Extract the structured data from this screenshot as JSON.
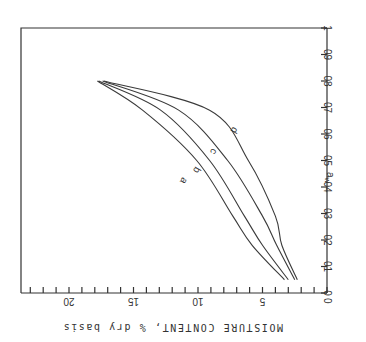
{
  "chart_data": {
    "type": "line",
    "orientation_note": "figure rendered rotated 90 degrees clockwise",
    "xlabel": "a_w",
    "ylabel": "MOISTURE CONTENT, % dry basis",
    "xlim": [
      0,
      1
    ],
    "ylim": [
      0,
      24
    ],
    "x_ticks": [
      "0",
      "0.1",
      "0.2",
      "0.3",
      "0.4",
      "0.5",
      "0.6",
      "0.7",
      "0.8",
      "0.9",
      "1"
    ],
    "x_tick_values": [
      0,
      0.1,
      0.2,
      0.3,
      0.4,
      0.5,
      0.6,
      0.7,
      0.8,
      0.9,
      1.0
    ],
    "y_ticks": [
      "0",
      "5",
      "10",
      "15",
      "20"
    ],
    "y_tick_values": [
      0,
      5,
      10,
      15,
      20
    ],
    "y_minor_step": 1,
    "grid": false,
    "series": [
      {
        "name": "a",
        "x": [
          0.05,
          0.18,
          0.29,
          0.5,
          0.69,
          0.8
        ],
        "values": [
          3.3,
          5.8,
          7.3,
          10.1,
          14.3,
          17.8
        ]
      },
      {
        "name": "b",
        "x": [
          0.05,
          0.18,
          0.29,
          0.5,
          0.69,
          0.8
        ],
        "values": [
          3.0,
          5.0,
          6.4,
          9.1,
          12.9,
          17.7
        ]
      },
      {
        "name": "c",
        "x": [
          0.05,
          0.18,
          0.29,
          0.5,
          0.69,
          0.8
        ],
        "values": [
          2.5,
          3.9,
          5.0,
          7.7,
          11.5,
          17.4
        ]
      },
      {
        "name": "d",
        "x": [
          0.05,
          0.18,
          0.29,
          0.5,
          0.69,
          0.8
        ],
        "values": [
          2.3,
          3.5,
          4.0,
          6.1,
          9.1,
          17.3
        ]
      }
    ],
    "curve_labels": [
      {
        "text": "a",
        "x": 0.43,
        "y": 11.3
      },
      {
        "text": "b",
        "x": 0.47,
        "y": 10.3
      },
      {
        "text": "c",
        "x": 0.54,
        "y": 9.0
      },
      {
        "text": "d",
        "x": 0.62,
        "y": 7.4
      }
    ]
  }
}
